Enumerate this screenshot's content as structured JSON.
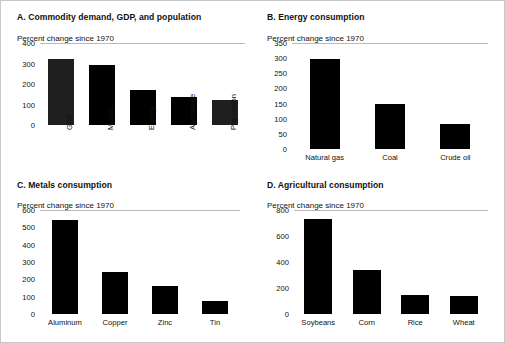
{
  "figure": {
    "background": "#ffffff",
    "bar_color": "#000000",
    "axis_color": "#b9b9b9",
    "text_color": "#111111"
  },
  "panels": [
    {
      "id": "a",
      "title": "A. Commodity demand, GDP, and population",
      "axis_note": "Percent change since 1970",
      "label_orientation": "vertical"
    },
    {
      "id": "b",
      "title": "B. Energy consumption",
      "axis_note": "Percent change since 1970",
      "label_orientation": "horizontal"
    },
    {
      "id": "c",
      "title": "C. Metals consumption",
      "axis_note": "Percent change since 1970",
      "label_orientation": "horizontal"
    },
    {
      "id": "d",
      "title": "D. Agricultural consumption",
      "axis_note": "Percent change since 1970",
      "label_orientation": "horizontal"
    }
  ],
  "chart_data": [
    {
      "type": "bar",
      "panel": "A",
      "title": "A. Commodity demand, GDP, and population",
      "xlabel": "",
      "ylabel": "Percent change since 1970",
      "categories": [
        "GDP",
        "Metals",
        "Energy",
        "Agriculture",
        "Population"
      ],
      "values": [
        322,
        295,
        172,
        138,
        120
      ],
      "ylim": [
        0,
        400
      ],
      "yticks": [
        0,
        100,
        200,
        300,
        400
      ],
      "ticklabels": [
        "0",
        "100",
        "200",
        "300",
        "400"
      ],
      "grid": false,
      "legend": "none"
    },
    {
      "type": "bar",
      "panel": "B",
      "title": "B. Energy consumption",
      "xlabel": "",
      "ylabel": "Percent change since 1970",
      "categories": [
        "Natural  gas",
        "Coal",
        "Crude oil"
      ],
      "values": [
        298,
        147,
        82
      ],
      "ylim": [
        0,
        350
      ],
      "yticks": [
        0,
        50,
        100,
        150,
        200,
        250,
        300,
        350
      ],
      "ticklabels": [
        "0",
        "50",
        "100",
        "150",
        "200",
        "250",
        "300",
        "350"
      ],
      "grid": false,
      "legend": "none"
    },
    {
      "type": "bar",
      "panel": "C",
      "title": "C. Metals consumption",
      "xlabel": "",
      "ylabel": "Percent change since 1970",
      "categories": [
        "Aluminum",
        "Copper",
        "Zinc",
        "Tin"
      ],
      "values": [
        543,
        242,
        160,
        75
      ],
      "ylim": [
        0,
        600
      ],
      "yticks": [
        0,
        100,
        200,
        300,
        400,
        500,
        600
      ],
      "ticklabels": [
        "0",
        "100",
        "200",
        "300",
        "400",
        "500",
        "600"
      ],
      "grid": false,
      "legend": "none"
    },
    {
      "type": "bar",
      "panel": "D",
      "title": "D. Agricultural consumption",
      "xlabel": "",
      "ylabel": "Percent change since 1970",
      "categories": [
        "Soybeans",
        "Corn",
        "Rice",
        "Wheat"
      ],
      "values": [
        728,
        340,
        145,
        138
      ],
      "ylim": [
        0,
        800
      ],
      "yticks": [
        0,
        200,
        400,
        600,
        800
      ],
      "ticklabels": [
        "0",
        "200",
        "400",
        "600",
        "800"
      ],
      "grid": false,
      "legend": "none"
    }
  ]
}
